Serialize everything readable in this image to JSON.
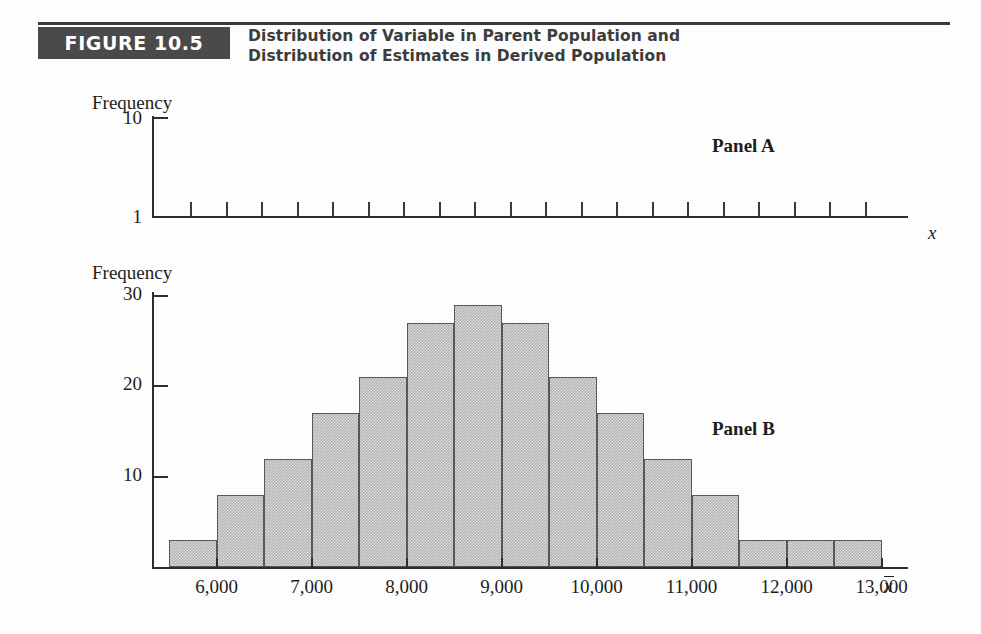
{
  "header": {
    "badge_label": "FIGURE 10.5",
    "title_line1": "Distribution of Variable in Parent Population and",
    "title_line2": "Distribution of Estimates in Derived Population",
    "badge_bg": "#4a4a4a",
    "badge_text_color": "#ffffff",
    "rule_color": "#3a3a3a"
  },
  "colors": {
    "bar_fill": "#b4b4b4",
    "bar_stroke": "#575757",
    "axis": "#2e2e2e",
    "text": "#1d1d1d"
  },
  "chart_data": [
    {
      "type": "bar",
      "panel": "Panel A",
      "title": "Distribution of Variable in Parent Population",
      "xlabel": "x",
      "ylabel": "Frequency",
      "ytick_labels": [
        "1",
        "10"
      ],
      "ylim": [
        1,
        10
      ],
      "grid": false,
      "legend": "none",
      "note": "Uniform parent population: every value occurs with frequency 1",
      "categories": [
        "1",
        "2",
        "3",
        "4",
        "5",
        "6",
        "7",
        "8",
        "9",
        "10",
        "11",
        "12",
        "13",
        "14",
        "15",
        "16",
        "17",
        "18",
        "19",
        "20"
      ],
      "values": [
        1,
        1,
        1,
        1,
        1,
        1,
        1,
        1,
        1,
        1,
        1,
        1,
        1,
        1,
        1,
        1,
        1,
        1,
        1,
        1
      ]
    },
    {
      "type": "bar",
      "panel": "Panel B",
      "title": "Distribution of Estimates in Derived Population",
      "xlabel": "x̄",
      "ylabel": "Frequency",
      "ytick_labels": [
        "10",
        "20",
        "30"
      ],
      "ytick_values": [
        10,
        20,
        30
      ],
      "ylim": [
        0,
        30
      ],
      "xtick_labels": [
        "6,000",
        "7,000",
        "8,000",
        "9,000",
        "10,000",
        "11,000",
        "12,000",
        "13,000"
      ],
      "xtick_values": [
        6000,
        7000,
        8000,
        9000,
        10000,
        11000,
        12000,
        13000
      ],
      "xlim": [
        5500,
        13500
      ],
      "grid": false,
      "legend": "none",
      "bin_centers": [
        5750,
        6250,
        6750,
        7250,
        7750,
        8250,
        8750,
        9250,
        9750,
        10250,
        10750,
        11250,
        11750,
        12250,
        12750
      ],
      "values": [
        3,
        8,
        12,
        17,
        21,
        27,
        29,
        27,
        21,
        17,
        12,
        8,
        3,
        3,
        3
      ]
    }
  ],
  "panelA": {
    "label": "Panel A",
    "ylabel": "Frequency",
    "ytop": "10",
    "ybottom": "1",
    "xlabel": "x"
  },
  "panelB": {
    "label": "Panel B",
    "ylabel": "Frequency",
    "xlabel_base": "x"
  }
}
